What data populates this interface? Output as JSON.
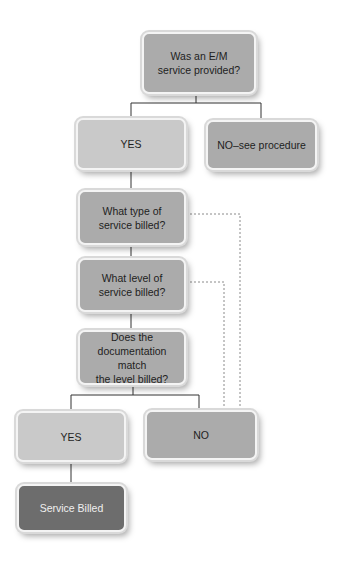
{
  "diagram": {
    "type": "flowchart",
    "nodes": {
      "question_em": {
        "label": "Was an E/M\nservice provided?"
      },
      "yes_top": {
        "label": "YES"
      },
      "no_see_procedure": {
        "label": "NO–see procedure"
      },
      "question_type": {
        "label": "What type of\nservice billed?"
      },
      "question_level": {
        "label": "What level of\nservice billed?"
      },
      "question_doc_match": {
        "label": "Does the\ndocumentation match\nthe level billed?"
      },
      "yes_bottom": {
        "label": "YES"
      },
      "no_bottom": {
        "label": "NO"
      },
      "service_billed": {
        "label": "Service Billed"
      }
    },
    "edges": [
      {
        "from": "question_em",
        "to": "yes_top",
        "style": "solid"
      },
      {
        "from": "question_em",
        "to": "no_see_procedure",
        "style": "solid"
      },
      {
        "from": "yes_top",
        "to": "question_type",
        "style": "solid"
      },
      {
        "from": "question_type",
        "to": "question_level",
        "style": "solid"
      },
      {
        "from": "question_level",
        "to": "question_doc_match",
        "style": "solid"
      },
      {
        "from": "question_doc_match",
        "to": "yes_bottom",
        "style": "solid"
      },
      {
        "from": "question_doc_match",
        "to": "no_bottom",
        "style": "solid"
      },
      {
        "from": "yes_bottom",
        "to": "service_billed",
        "style": "solid"
      },
      {
        "from": "question_type",
        "to": "no_bottom",
        "style": "dashed"
      },
      {
        "from": "question_level",
        "to": "no_bottom",
        "style": "dashed"
      }
    ],
    "colors": {
      "medium": "#ababab",
      "light": "#c9c9c9",
      "dark": "#6d6d6d",
      "line": "#333333",
      "dashed_line": "#8a8a8a"
    }
  }
}
